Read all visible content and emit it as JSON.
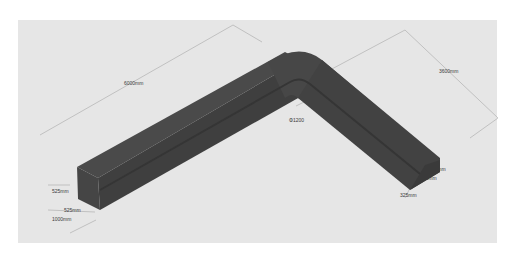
{
  "diagram": {
    "type": "isometric-duct-elbow",
    "colors": {
      "background": "#ffffff",
      "canvas": "#e6e6e6",
      "duct_top": "#4a4a4a",
      "duct_side": "#3c3c3c",
      "duct_end": "#454545",
      "duct_groove": "#353535",
      "dimension_line": "#9a9a9a",
      "label_text": "#3a3a3a"
    },
    "labels": {
      "long_leg_length": "6000mm",
      "short_leg_length": "3600mm",
      "bend_diameter": "Φ1200",
      "left_end_height": "525mm",
      "left_end_width": "525mm",
      "left_end_outer": "1000mm",
      "right_end_height": "700mm",
      "right_end_inner": "350mm",
      "right_end_width": "325mm"
    }
  }
}
